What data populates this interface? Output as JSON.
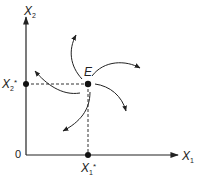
{
  "diagram": {
    "type": "phase-diagram",
    "axes": {
      "x": {
        "label": "X",
        "subscript": "1"
      },
      "y": {
        "label": "X",
        "subscript": "2"
      },
      "origin_label": "0"
    },
    "equilibrium": {
      "label": "E",
      "x_value": {
        "label": "X",
        "subscript": "1",
        "superscript": "*"
      },
      "y_value": {
        "label": "X",
        "subscript": "2",
        "superscript": "*"
      }
    },
    "trajectories": [
      {
        "name": "upper-left",
        "direction": "outward-up"
      },
      {
        "name": "upper-right",
        "direction": "outward-right"
      },
      {
        "name": "right",
        "direction": "outward-down-right"
      },
      {
        "name": "lower",
        "direction": "outward-down-left"
      },
      {
        "name": "left",
        "direction": "outward-up-left"
      }
    ],
    "colors": {
      "line": "#222222",
      "dashed": "#333333",
      "point": "#111111"
    }
  }
}
